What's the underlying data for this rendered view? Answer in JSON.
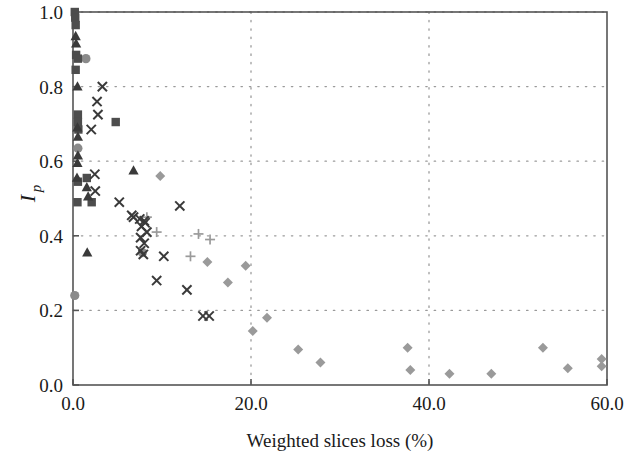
{
  "chart_data": {
    "type": "scatter",
    "title": "",
    "xlabel": "Weighted slices loss (%)",
    "ylabel": "Ip",
    "ylabel_base": "I",
    "ylabel_sub": "p",
    "xlim": [
      0.0,
      60.0
    ],
    "ylim": [
      0.0,
      1.0
    ],
    "xticks": [
      0.0,
      20.0,
      40.0,
      60.0
    ],
    "xtick_labels": [
      "0.0",
      "20.0",
      "40.0",
      "60.0"
    ],
    "yticks": [
      0.0,
      0.2,
      0.4,
      0.6,
      0.8,
      1.0
    ],
    "ytick_labels": [
      "0.0",
      "0.2",
      "0.4",
      "0.6",
      "0.8",
      "1.0"
    ],
    "grid": true,
    "grid_style": "dotted",
    "grid_color": "#9a9a9a",
    "legend": "none",
    "frame_color": "#555555",
    "series": [
      {
        "name": "square",
        "marker": "square",
        "color": "#4d4d4d",
        "points": [
          [
            0.2,
            1.0
          ],
          [
            0.25,
            0.985
          ],
          [
            0.3,
            0.965
          ],
          [
            0.35,
            0.885
          ],
          [
            0.55,
            0.875
          ],
          [
            0.3,
            0.845
          ],
          [
            0.55,
            0.725
          ],
          [
            0.55,
            0.705
          ],
          [
            0.6,
            0.685
          ],
          [
            0.55,
            0.545
          ],
          [
            1.55,
            0.555
          ],
          [
            0.5,
            0.49
          ],
          [
            2.1,
            0.49
          ],
          [
            4.8,
            0.705
          ]
        ]
      },
      {
        "name": "triangle",
        "marker": "triangle",
        "color": "#3a3a3a",
        "points": [
          [
            0.3,
            0.935
          ],
          [
            0.35,
            0.915
          ],
          [
            0.5,
            0.8
          ],
          [
            0.5,
            0.69
          ],
          [
            0.55,
            0.665
          ],
          [
            0.55,
            0.615
          ],
          [
            0.5,
            0.595
          ],
          [
            0.45,
            0.555
          ],
          [
            6.8,
            0.575
          ],
          [
            1.55,
            0.53
          ],
          [
            1.7,
            0.505
          ],
          [
            1.6,
            0.355
          ]
        ]
      },
      {
        "name": "circle",
        "marker": "circle",
        "color": "#8a8a8a",
        "points": [
          [
            1.45,
            0.875
          ],
          [
            0.55,
            0.635
          ],
          [
            0.2,
            0.24
          ],
          [
            7.8,
            0.355
          ]
        ]
      },
      {
        "name": "cross-x",
        "marker": "x",
        "color": "#3a3a3a",
        "points": [
          [
            3.3,
            0.8
          ],
          [
            2.7,
            0.76
          ],
          [
            2.8,
            0.725
          ],
          [
            2.05,
            0.685
          ],
          [
            2.45,
            0.565
          ],
          [
            2.5,
            0.52
          ],
          [
            5.2,
            0.49
          ],
          [
            12.0,
            0.48
          ],
          [
            6.6,
            0.455
          ],
          [
            6.8,
            0.45
          ],
          [
            7.5,
            0.445
          ],
          [
            8.0,
            0.44
          ],
          [
            8.1,
            0.435
          ],
          [
            7.7,
            0.425
          ],
          [
            8.3,
            0.41
          ],
          [
            7.6,
            0.395
          ],
          [
            8.0,
            0.38
          ],
          [
            7.6,
            0.36
          ],
          [
            7.9,
            0.35
          ],
          [
            10.2,
            0.345
          ],
          [
            9.4,
            0.28
          ],
          [
            12.8,
            0.255
          ],
          [
            14.6,
            0.185
          ],
          [
            15.3,
            0.185
          ]
        ]
      },
      {
        "name": "plus",
        "marker": "plus",
        "color": "#9a9a9a",
        "points": [
          [
            8.3,
            0.45
          ],
          [
            9.4,
            0.41
          ],
          [
            14.1,
            0.405
          ],
          [
            13.2,
            0.345
          ],
          [
            15.4,
            0.39
          ]
        ]
      },
      {
        "name": "diamond",
        "marker": "diamond",
        "color": "#9a9a9a",
        "points": [
          [
            9.8,
            0.56
          ],
          [
            15.1,
            0.33
          ],
          [
            19.4,
            0.32
          ],
          [
            17.4,
            0.275
          ],
          [
            20.2,
            0.145
          ],
          [
            21.8,
            0.18
          ],
          [
            25.3,
            0.095
          ],
          [
            27.8,
            0.06
          ],
          [
            37.6,
            0.1
          ],
          [
            37.9,
            0.04
          ],
          [
            42.3,
            0.03
          ],
          [
            47.0,
            0.03
          ],
          [
            52.8,
            0.1
          ],
          [
            55.6,
            0.045
          ],
          [
            59.4,
            0.07
          ],
          [
            59.4,
            0.05
          ]
        ]
      }
    ]
  }
}
